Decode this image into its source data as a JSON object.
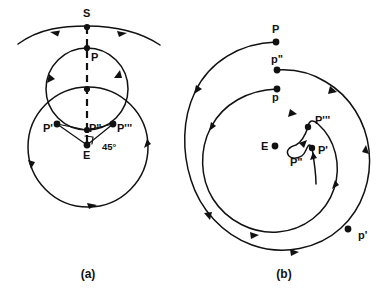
{
  "figure": {
    "background_color": "#ffffff",
    "ink_color": "#111111",
    "width": 386,
    "height": 298
  },
  "panels": [
    {
      "id": "panel-a",
      "caption": "(a)",
      "caption_pos": {
        "x": 88,
        "y": 278
      },
      "description": "Epicycle-and-deferent construction with sphere arc S, planet point P, and successive positions P', P'', P''' about the Earth E, with a 45 degree angle marked at E.",
      "labels": [
        {
          "name": "S",
          "text": "S",
          "x": 83,
          "y": 17,
          "size": 11
        },
        {
          "name": "P",
          "text": "P",
          "x": 91,
          "y": 61,
          "size": 11
        },
        {
          "name": "Pp",
          "text": "P'",
          "x": 43,
          "y": 132,
          "size": 11
        },
        {
          "name": "Ppp",
          "text": "P\"",
          "x": 89,
          "y": 132,
          "size": 11
        },
        {
          "name": "Pppp",
          "text": "P'''",
          "x": 117,
          "y": 132,
          "size": 11
        },
        {
          "name": "E",
          "text": "E",
          "x": 83,
          "y": 159,
          "size": 11
        },
        {
          "name": "angle",
          "text": "45°",
          "x": 102,
          "y": 150,
          "size": 10
        }
      ],
      "points": [
        {
          "name": "S",
          "x": 87,
          "y": 27
        },
        {
          "name": "P",
          "x": 87,
          "y": 48
        },
        {
          "name": "C",
          "x": 87,
          "y": 89
        },
        {
          "name": "Pp",
          "x": 57,
          "y": 124
        },
        {
          "name": "Ppp",
          "x": 87,
          "y": 130
        },
        {
          "name": "Pppp",
          "x": 113,
          "y": 124
        },
        {
          "name": "E",
          "x": 87,
          "y": 145
        }
      ],
      "angle_value": "45°"
    },
    {
      "id": "panel-b",
      "caption": "(b)",
      "caption_pos": {
        "x": 284,
        "y": 278
      },
      "description": "Spiral trajectory of a planet about the Earth E, marked with successive positions P, p'', p, P''', P'', P' and p'.",
      "labels": [
        {
          "name": "P",
          "text": "P",
          "x": 272,
          "y": 33,
          "size": 11
        },
        {
          "name": "ppp",
          "text": "p\"",
          "x": 271,
          "y": 63,
          "size": 11
        },
        {
          "name": "p",
          "text": "p",
          "x": 272,
          "y": 101,
          "size": 11
        },
        {
          "name": "Pppp",
          "text": "P'''",
          "x": 315,
          "y": 124,
          "size": 11
        },
        {
          "name": "E",
          "text": "E",
          "x": 261,
          "y": 150,
          "size": 11
        },
        {
          "name": "Ppp",
          "text": "P\"",
          "x": 290,
          "y": 166,
          "size": 11
        },
        {
          "name": "Pp",
          "text": "P'",
          "x": 318,
          "y": 154,
          "size": 11
        },
        {
          "name": "pp",
          "text": "p'",
          "x": 358,
          "y": 239,
          "size": 11
        }
      ],
      "points": [
        {
          "name": "P",
          "x": 276,
          "y": 42
        },
        {
          "name": "ppp",
          "x": 277,
          "y": 70
        },
        {
          "name": "p",
          "x": 277,
          "y": 89
        },
        {
          "name": "Pppp",
          "x": 308,
          "y": 127
        },
        {
          "name": "Ppp",
          "x": 297,
          "y": 152
        },
        {
          "name": "Pp",
          "x": 312,
          "y": 148
        },
        {
          "name": "E",
          "x": 275,
          "y": 146
        },
        {
          "name": "pp",
          "x": 348,
          "y": 229
        }
      ]
    }
  ]
}
